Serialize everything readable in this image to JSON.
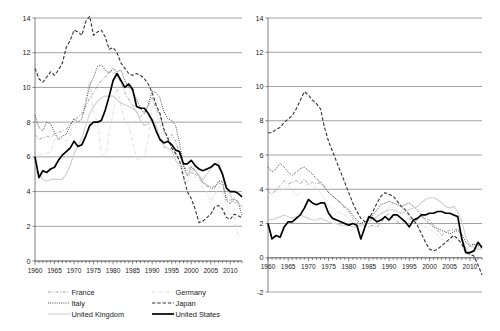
{
  "figure": {
    "title": "",
    "panel_count": 2
  },
  "legend": {
    "position": "bottom",
    "entries": [
      {
        "label": "France",
        "style": "dash-dot",
        "color": "#9a9a9a",
        "width": 0.9,
        "column": "left",
        "row": 0
      },
      {
        "label": "Germany",
        "style": "dash-dot",
        "color": "#d8d8d8",
        "width": 0.9,
        "column": "right",
        "row": 0
      },
      {
        "label": "Italy",
        "style": "dotted",
        "color": "#3a3a3a",
        "width": 1.0,
        "column": "left",
        "row": 1
      },
      {
        "label": "Japan",
        "style": "dashed",
        "color": "#333333",
        "width": 1.1,
        "column": "right",
        "row": 1
      },
      {
        "label": "United Kingdom",
        "style": "solid",
        "color": "#cfcfcf",
        "width": 1.1,
        "column": "left",
        "row": 2
      },
      {
        "label": "United States",
        "style": "solid",
        "color": "#000000",
        "width": 1.7,
        "column": "right",
        "row": 2
      }
    ]
  },
  "chart_data": [
    {
      "panel": "left",
      "type": "line",
      "title": "",
      "xlabel": "",
      "ylabel": "",
      "xlim": [
        1960,
        2013
      ],
      "ylim": [
        0,
        14
      ],
      "yticks": [
        0,
        2,
        4,
        6,
        8,
        10,
        12,
        14
      ],
      "xticks": [
        1960,
        1965,
        1970,
        1975,
        1980,
        1985,
        1990,
        1995,
        2000,
        2005,
        2010
      ],
      "xtick_labels": [
        "1960",
        "1965",
        "1970",
        "1975",
        "1980",
        "1985",
        "1990",
        "1995",
        "2000",
        "2005",
        "2010"
      ],
      "ytick_labels": [
        "0",
        "2",
        "4",
        "6",
        "8",
        "10",
        "12",
        "14"
      ],
      "grid": true,
      "minor_xticks": true,
      "x": [
        1960,
        1961,
        1962,
        1963,
        1964,
        1965,
        1966,
        1967,
        1968,
        1969,
        1970,
        1971,
        1972,
        1973,
        1974,
        1975,
        1976,
        1977,
        1978,
        1979,
        1980,
        1981,
        1982,
        1983,
        1984,
        1985,
        1986,
        1987,
        1988,
        1989,
        1990,
        1991,
        1992,
        1993,
        1994,
        1995,
        1996,
        1997,
        1998,
        1999,
        2000,
        2001,
        2002,
        2003,
        2004,
        2005,
        2006,
        2007,
        2008,
        2009,
        2010,
        2011,
        2012,
        2013
      ],
      "series": [
        {
          "name": "France",
          "style": "dash-dot",
          "color": "#9a9a9a",
          "width": 0.9,
          "values": [
            7.3,
            7.0,
            7.1,
            7.2,
            7.1,
            7.3,
            7.4,
            7.5,
            7.6,
            7.9,
            8.1,
            8.3,
            8.5,
            8.9,
            9.4,
            9.7,
            10.1,
            10.4,
            10.6,
            10.9,
            11.0,
            10.7,
            10.3,
            9.7,
            9.3,
            9.0,
            8.6,
            8.3,
            8.5,
            9.0,
            9.4,
            8.8,
            8.4,
            7.5,
            7.0,
            7.3,
            6.9,
            6.2,
            5.5,
            5.2,
            5.5,
            5.2,
            4.9,
            4.5,
            4.3,
            4.3,
            4.3,
            4.5,
            4.4,
            3.6,
            3.5,
            3.6,
            3.4,
            3.2
          ]
        },
        {
          "name": "Germany",
          "style": "dash-dot",
          "color": "#d8d8d8",
          "width": 0.9,
          "values": [
            6.4,
            6.1,
            6.2,
            6.2,
            6.3,
            7.0,
            7.0,
            7.1,
            6.9,
            7.2,
            8.3,
            8.2,
            8.0,
            9.3,
            10.4,
            8.5,
            8.0,
            6.2,
            5.9,
            7.4,
            8.5,
            10.0,
            9.0,
            8.0,
            7.8,
            6.9,
            5.9,
            5.8,
            6.1,
            7.0,
            8.9,
            8.6,
            8.0,
            6.5,
            6.9,
            6.8,
            6.2,
            5.7,
            4.6,
            4.5,
            5.3,
            4.8,
            4.8,
            4.1,
            4.0,
            3.4,
            3.8,
            4.3,
            4.0,
            3.2,
            2.7,
            2.6,
            1.5,
            1.6
          ]
        },
        {
          "name": "Italy",
          "style": "dotted",
          "color": "#3a3a3a",
          "width": 1.0,
          "values": [
            8.4,
            7.7,
            7.5,
            8.0,
            7.9,
            7.4,
            7.0,
            7.2,
            7.3,
            7.8,
            8.2,
            8.0,
            8.2,
            9.1,
            10.1,
            10.6,
            11.2,
            11.3,
            11.0,
            10.8,
            11.1,
            10.9,
            11.0,
            10.4,
            10.0,
            9.8,
            9.3,
            8.8,
            8.5,
            9.0,
            9.8,
            9.7,
            9.4,
            8.6,
            8.2,
            8.1,
            7.8,
            6.8,
            5.5,
            4.9,
            5.4,
            5.2,
            4.9,
            4.5,
            4.4,
            4.2,
            4.2,
            4.6,
            4.6,
            3.5,
            3.3,
            3.6,
            3.4,
            2.6
          ]
        },
        {
          "name": "Japan",
          "style": "dashed",
          "color": "#333333",
          "width": 1.1,
          "values": [
            11.1,
            10.5,
            10.3,
            10.6,
            10.9,
            10.7,
            11.0,
            11.4,
            12.3,
            12.7,
            13.3,
            13.2,
            13.0,
            13.8,
            14.1,
            13.0,
            13.2,
            13.3,
            12.9,
            12.2,
            12.3,
            12.0,
            11.4,
            11.1,
            10.8,
            10.7,
            10.8,
            10.7,
            10.5,
            10.2,
            9.7,
            9.0,
            8.5,
            7.6,
            7.1,
            6.5,
            6.2,
            5.8,
            4.9,
            4.0,
            3.6,
            3.0,
            2.2,
            2.3,
            2.5,
            2.7,
            3.1,
            3.2,
            3.0,
            2.5,
            2.4,
            2.7,
            2.6,
            2.5
          ]
        },
        {
          "name": "United Kingdom",
          "style": "solid",
          "color": "#cfcfcf",
          "width": 1.1,
          "values": [
            5.2,
            5.0,
            4.7,
            4.6,
            4.7,
            4.7,
            4.7,
            4.7,
            5.0,
            5.5,
            6.2,
            6.6,
            7.1,
            7.8,
            8.5,
            8.9,
            9.2,
            9.4,
            9.5,
            9.5,
            9.5,
            9.3,
            9.1,
            9.0,
            8.9,
            8.8,
            8.6,
            8.1,
            7.8,
            7.9,
            8.2,
            7.8,
            7.1,
            6.6,
            6.5,
            6.4,
            5.8,
            5.5,
            5.3,
            5.0,
            5.1,
            5.0,
            4.9,
            4.7,
            5.0,
            5.3,
            5.6,
            5.7,
            5.1,
            4.3,
            3.8,
            3.4,
            3.3,
            3.1
          ]
        },
        {
          "name": "United States",
          "style": "solid",
          "color": "#000000",
          "width": 1.7,
          "values": [
            6.0,
            4.8,
            5.2,
            5.1,
            5.3,
            5.4,
            5.8,
            6.1,
            6.3,
            6.5,
            6.9,
            6.6,
            6.7,
            7.2,
            7.8,
            8.0,
            8.0,
            8.1,
            8.7,
            9.5,
            10.4,
            10.8,
            10.4,
            10.0,
            10.2,
            9.9,
            8.9,
            8.8,
            8.8,
            8.5,
            8.1,
            7.5,
            7.0,
            6.8,
            6.9,
            6.7,
            6.4,
            6.3,
            5.6,
            5.6,
            5.8,
            5.5,
            5.3,
            5.2,
            5.3,
            5.4,
            5.6,
            5.5,
            5.0,
            4.2,
            4.0,
            4.0,
            3.9,
            3.7
          ]
        }
      ]
    },
    {
      "panel": "right",
      "type": "line",
      "title": "",
      "xlabel": "",
      "ylabel": "",
      "xlim": [
        1960,
        2013
      ],
      "ylim": [
        -2,
        14
      ],
      "yticks": [
        -2,
        0,
        2,
        4,
        6,
        8,
        10,
        12,
        14
      ],
      "xticks": [
        1960,
        1965,
        1970,
        1975,
        1980,
        1985,
        1990,
        1995,
        2000,
        2005,
        2010
      ],
      "xtick_labels": [
        "1960",
        "1965",
        "1970",
        "1975",
        "1980",
        "1985",
        "1990",
        "1995",
        "2000",
        "2005",
        "2010"
      ],
      "ytick_labels": [
        "-2",
        "0",
        "2",
        "4",
        "6",
        "8",
        "10",
        "12",
        "14"
      ],
      "grid": true,
      "minor_xticks": true,
      "x": [
        1960,
        1961,
        1962,
        1963,
        1964,
        1965,
        1966,
        1967,
        1968,
        1969,
        1970,
        1971,
        1972,
        1973,
        1974,
        1975,
        1976,
        1977,
        1978,
        1979,
        1980,
        1981,
        1982,
        1983,
        1984,
        1985,
        1986,
        1987,
        1988,
        1989,
        1990,
        1991,
        1992,
        1993,
        1994,
        1995,
        1996,
        1997,
        1998,
        1999,
        2000,
        2001,
        2002,
        2003,
        2004,
        2005,
        2006,
        2007,
        2008,
        2009,
        2010,
        2011,
        2012,
        2013
      ],
      "series": [
        {
          "name": "France",
          "style": "dash-dot",
          "color": "#9a9a9a",
          "width": 0.9,
          "values": [
            3.9,
            3.7,
            4.0,
            4.2,
            4.5,
            4.3,
            4.4,
            4.5,
            4.3,
            4.6,
            4.3,
            4.4,
            4.3,
            4.4,
            4.2,
            3.8,
            3.6,
            3.4,
            3.2,
            2.9,
            2.7,
            2.3,
            2.1,
            1.9,
            1.8,
            1.8,
            1.9,
            1.8,
            2.0,
            2.4,
            2.6,
            2.3,
            2.1,
            2.0,
            2.2,
            2.3,
            2.1,
            2.2,
            2.4,
            2.3,
            2.2,
            1.9,
            1.6,
            1.3,
            1.5,
            1.6,
            1.6,
            1.7,
            1.2,
            0.5,
            0.7,
            0.8,
            0.6,
            0.5
          ]
        },
        {
          "name": "Germany",
          "style": "dash-dot",
          "color": "#d8d8d8",
          "width": 0.9,
          "values": [
            4.1,
            4.0,
            3.9,
            3.9,
            4.0,
            4.2,
            4.0,
            3.6,
            3.8,
            4.2,
            4.3,
            4.2,
            4.0,
            3.8,
            3.4,
            3.0,
            2.9,
            2.7,
            2.6,
            2.5,
            2.3,
            2.0,
            1.9,
            1.9,
            2.0,
            2.1,
            2.2,
            2.3,
            2.5,
            2.7,
            3.0,
            3.2,
            3.3,
            3.0,
            2.6,
            2.4,
            2.2,
            2.0,
            1.9,
            1.8,
            1.7,
            1.5,
            1.3,
            1.1,
            1.0,
            0.9,
            1.0,
            1.2,
            1.1,
            0.4,
            0.6,
            0.9,
            0.8,
            0.7
          ]
        },
        {
          "name": "Italy",
          "style": "dotted",
          "color": "#3a3a3a",
          "width": 1.0,
          "values": [
            5.3,
            5.0,
            5.2,
            5.5,
            5.3,
            5.0,
            4.8,
            5.0,
            5.2,
            5.3,
            5.1,
            4.9,
            4.6,
            4.4,
            4.1,
            3.8,
            3.6,
            3.4,
            3.2,
            3.0,
            2.8,
            2.5,
            2.2,
            2.0,
            2.1,
            2.2,
            2.5,
            2.8,
            3.1,
            3.2,
            3.3,
            3.2,
            3.1,
            3.0,
            3.1,
            3.2,
            3.0,
            2.8,
            2.5,
            2.2,
            2.0,
            1.8,
            1.7,
            1.6,
            1.5,
            1.4,
            1.5,
            1.6,
            1.4,
            0.9,
            0.7,
            0.8,
            0.7,
            0.6
          ]
        },
        {
          "name": "Japan",
          "style": "dashed",
          "color": "#333333",
          "width": 1.1,
          "values": [
            7.3,
            7.3,
            7.5,
            7.6,
            7.9,
            8.1,
            8.3,
            8.7,
            9.2,
            9.7,
            9.5,
            9.2,
            9.0,
            8.7,
            7.6,
            6.8,
            6.2,
            5.6,
            5.0,
            4.4,
            3.8,
            3.2,
            2.7,
            2.3,
            2.1,
            2.3,
            2.7,
            3.2,
            3.6,
            3.8,
            3.7,
            3.6,
            3.3,
            3.0,
            2.8,
            2.5,
            2.2,
            1.9,
            1.4,
            0.9,
            0.5,
            0.4,
            0.5,
            0.7,
            0.9,
            1.1,
            1.3,
            1.1,
            0.8,
            0.3,
            0.2,
            0.1,
            -0.4,
            -1.0
          ]
        },
        {
          "name": "United Kingdom",
          "style": "solid",
          "color": "#cfcfcf",
          "width": 1.1,
          "values": [
            2.3,
            2.2,
            2.3,
            2.4,
            2.5,
            2.4,
            2.3,
            2.4,
            2.5,
            2.4,
            2.3,
            2.2,
            2.2,
            2.3,
            2.2,
            2.1,
            2.0,
            2.0,
            1.9,
            1.9,
            1.9,
            1.8,
            1.8,
            1.9,
            2.0,
            2.1,
            2.3,
            2.4,
            2.6,
            2.7,
            2.8,
            2.8,
            2.7,
            2.6,
            2.7,
            2.8,
            2.9,
            3.0,
            3.2,
            3.4,
            3.5,
            3.5,
            3.4,
            3.2,
            3.0,
            2.9,
            3.0,
            2.7,
            2.1,
            1.2,
            0.7,
            0.6,
            0.5,
            0.5
          ]
        },
        {
          "name": "United States",
          "style": "solid",
          "color": "#000000",
          "width": 1.7,
          "values": [
            2.0,
            1.1,
            1.3,
            1.2,
            1.8,
            2.1,
            2.1,
            2.3,
            2.5,
            2.9,
            3.4,
            3.2,
            3.1,
            3.2,
            3.2,
            2.6,
            2.3,
            2.2,
            2.1,
            2.0,
            1.9,
            2.0,
            1.9,
            1.1,
            1.8,
            2.4,
            2.3,
            2.1,
            2.2,
            2.4,
            2.2,
            2.5,
            2.5,
            2.3,
            2.1,
            1.8,
            2.2,
            2.3,
            2.5,
            2.5,
            2.6,
            2.6,
            2.7,
            2.7,
            2.6,
            2.6,
            2.5,
            2.4,
            1.1,
            0.3,
            0.3,
            0.4,
            0.9,
            0.6
          ]
        }
      ]
    }
  ]
}
